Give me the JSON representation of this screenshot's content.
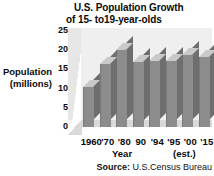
{
  "chart_data": {
    "type": "bar",
    "title": "U.S. Population Growth of 15- to19-year-olds",
    "title_line1": "U.S. Population Growth",
    "title_line2": "of 15- to19-year-olds",
    "xlabel": "Year",
    "ylabel": "Population (millions)",
    "ylabel_line1": "Population",
    "ylabel_line2": "(millions)",
    "categories": [
      "1960",
      "'70",
      "'80",
      "90",
      "'94",
      "'95",
      "'00",
      "'15"
    ],
    "values": [
      11,
      17,
      21,
      17.8,
      18,
      18,
      19.5,
      19
    ],
    "ylim": [
      0,
      25
    ],
    "yticks": [
      25,
      20,
      15,
      10,
      5,
      0
    ],
    "grid": false,
    "legend": null,
    "annotations": [
      "(est.)"
    ],
    "est_note": "(est.)",
    "source_label": "Source:",
    "source_value": "U.S.Census Bureau"
  }
}
